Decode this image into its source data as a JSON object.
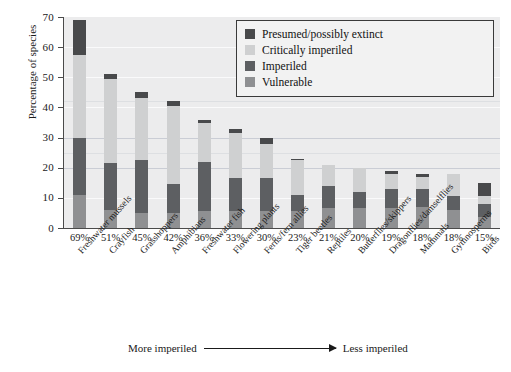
{
  "chart_data": {
    "type": "bar",
    "stacked": true,
    "title": "",
    "xlabel": "",
    "ylabel": "Percentage of species",
    "ylim": [
      0,
      70
    ],
    "ytick_step": 10,
    "yticks": [
      "0",
      "10",
      "20",
      "30",
      "40",
      "50",
      "60",
      "70"
    ],
    "grid": true,
    "legend_position": "top-right",
    "categories": [
      "Freshwater mussels",
      "Crayfish",
      "Grasshoppers",
      "Amphibians",
      "Freshwater fish",
      "Flowering plants",
      "Ferns/fern allies",
      "Tiger beetles",
      "Reptiles",
      "Butterflies/skippers",
      "Dragonflies/damselflies",
      "Mammals",
      "Gymnosperms",
      "Birds"
    ],
    "totals_labels": [
      "69%",
      "51%",
      "45%",
      "42%",
      "36%",
      "33%",
      "30%",
      "23%",
      "21%",
      "20%",
      "19%",
      "18%",
      "18%",
      "15%"
    ],
    "totals": [
      69,
      51,
      45,
      42,
      36,
      33,
      30,
      23,
      21,
      20,
      19,
      18,
      18,
      15
    ],
    "series": [
      {
        "name": "Vulnerable",
        "color": "#8f9092",
        "values": [
          11.0,
          6.0,
          5.0,
          5.0,
          5.5,
          5.5,
          5.5,
          5.5,
          6.5,
          6.5,
          6.5,
          7.0,
          6.0,
          3.5
        ]
      },
      {
        "name": "Imperiled",
        "color": "#5d5f62",
        "values": [
          19.0,
          15.5,
          17.5,
          9.5,
          16.5,
          11.0,
          11.0,
          5.5,
          7.5,
          5.5,
          6.5,
          6.0,
          4.5,
          4.5
        ]
      },
      {
        "name": "Critically imperiled",
        "color": "#cfd0d1",
        "values": [
          27.5,
          28.0,
          20.5,
          26.0,
          13.0,
          15.0,
          11.5,
          11.5,
          7.0,
          8.0,
          5.0,
          4.0,
          7.5,
          2.5
        ]
      },
      {
        "name": "Presumed/possibly extinct",
        "color": "#48494b",
        "values": [
          11.5,
          1.5,
          2.0,
          1.5,
          1.0,
          1.5,
          2.0,
          0.5,
          0.0,
          0.0,
          1.0,
          1.0,
          0.0,
          4.5
        ]
      }
    ]
  },
  "legend": {
    "items": [
      {
        "label": "Presumed/possibly extinct",
        "color": "#48494b"
      },
      {
        "label": "Critically imperiled",
        "color": "#cfd0d1"
      },
      {
        "label": "Imperiled",
        "color": "#5d5f62"
      },
      {
        "label": "Vulnerable",
        "color": "#8f9092"
      }
    ]
  },
  "footer": {
    "left_text": "More imperiled",
    "right_text": "Less imperiled",
    "caption_fragment": ""
  },
  "colors": {
    "plot_background": "#ececed",
    "axis": "#4a4a4a",
    "text": "#1a1a1a"
  }
}
